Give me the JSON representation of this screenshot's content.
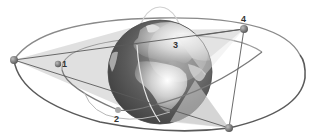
{
  "diagram": {
    "labels": {
      "one": "1",
      "two": "2",
      "three": "3",
      "four": "4"
    },
    "colors": {
      "orbit": "#6a6a6a",
      "orbit_light": "#c8c8c8",
      "coverage": "#d4d4d4",
      "satellite": "#777777",
      "ocean": "#5e5e5e",
      "land": "#b8b8b8",
      "label": "#333333"
    },
    "satellites": [
      {
        "id": "left-geo",
        "x": 14,
        "y": 60
      },
      {
        "id": "1",
        "x": 58,
        "y": 64
      },
      {
        "id": "2",
        "x": 118,
        "y": 110
      },
      {
        "id": "4",
        "x": 244,
        "y": 29
      },
      {
        "id": "bottom-geo",
        "x": 229,
        "y": 128
      }
    ]
  }
}
